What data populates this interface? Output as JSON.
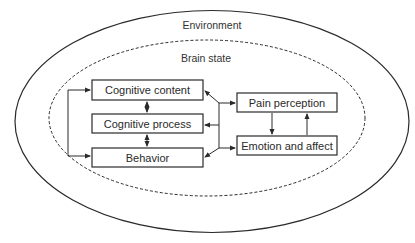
{
  "diagram": {
    "regions": {
      "environment": {
        "label": "Environment",
        "border": "solid"
      },
      "brain_state": {
        "label": "Brain state",
        "border": "dashed"
      }
    },
    "nodes": {
      "cognitive_content": {
        "label": "Cognitive content"
      },
      "cognitive_process": {
        "label": "Cognitive process"
      },
      "behavior": {
        "label": "Behavior"
      },
      "pain_perception": {
        "label": "Pain perception"
      },
      "emotion_affect": {
        "label": "Emotion and affect"
      }
    },
    "edges": [
      {
        "from": "cognitive_content",
        "to": "cognitive_process",
        "direction": "bidirectional"
      },
      {
        "from": "cognitive_process",
        "to": "behavior",
        "direction": "bidirectional"
      },
      {
        "from": "cognitive_content",
        "to": "behavior",
        "direction": "bidirectional",
        "route": "left-bracket"
      },
      {
        "from": "cognition_hub",
        "to": "cognitive_content",
        "direction": "forward"
      },
      {
        "from": "cognition_hub",
        "to": "cognitive_process",
        "direction": "forward"
      },
      {
        "from": "cognition_hub",
        "to": "behavior",
        "direction": "forward"
      },
      {
        "from": "cognition_hub",
        "to": "pain_perception",
        "direction": "forward"
      },
      {
        "from": "cognition_hub",
        "to": "emotion_affect",
        "direction": "forward"
      },
      {
        "from": "pain_perception",
        "to": "emotion_affect",
        "direction": "forward"
      },
      {
        "from": "emotion_affect",
        "to": "pain_perception",
        "direction": "forward"
      }
    ],
    "colors": {
      "stroke": "#2a2a2a",
      "background": "#ffffff",
      "text": "#2a2a2a"
    }
  }
}
